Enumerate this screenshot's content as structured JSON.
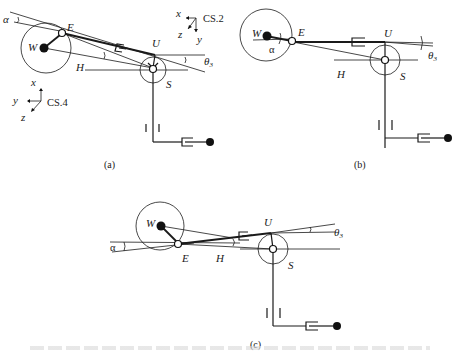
{
  "figure": {
    "panels": [
      {
        "id": "a",
        "caption": "(a)",
        "labels": {
          "W": "W",
          "E": "E",
          "U": "U",
          "H": "H",
          "S": "S",
          "alpha": "α",
          "theta": "θ",
          "theta_sub": "3"
        },
        "coord_systems": [
          {
            "name": "CS.2",
            "axes": [
              "x",
              "y",
              "z"
            ]
          },
          {
            "name": "CS.4",
            "axes": [
              "x",
              "y",
              "z"
            ]
          }
        ]
      },
      {
        "id": "b",
        "caption": "(b)",
        "labels": {
          "W": "W",
          "E": "E",
          "U": "U",
          "H": "H",
          "S": "S",
          "alpha": "α",
          "theta": "θ",
          "theta_sub": "3"
        }
      },
      {
        "id": "c",
        "caption": "(c)",
        "labels": {
          "W": "W",
          "E": "E",
          "U": "U",
          "H": "H",
          "S": "S",
          "alpha": "α",
          "theta": "θ",
          "theta_sub": "3"
        }
      }
    ]
  }
}
